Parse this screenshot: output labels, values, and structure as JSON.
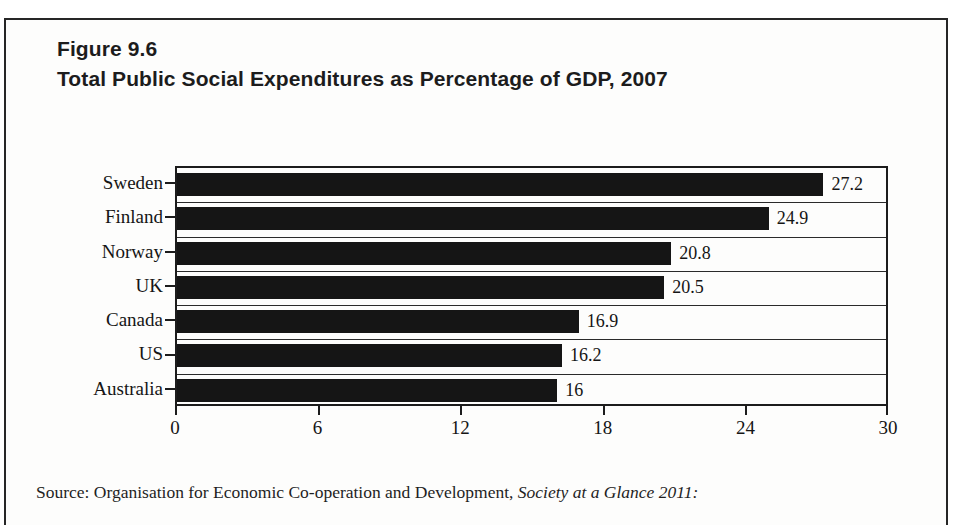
{
  "figure": {
    "number": "Figure 9.6",
    "title": "Total Public Social Expenditures as Percentage of GDP, 2007"
  },
  "source_note": {
    "prefix": "Source: Organisation for Economic Co-operation and Development,",
    "italic_title": "Society at a Glance 2011:"
  },
  "chart_data": {
    "type": "bar",
    "orientation": "horizontal",
    "title": "Total Public Social Expenditures as Percentage of GDP, 2007",
    "xlabel": "",
    "ylabel": "",
    "xlim": [
      0,
      30
    ],
    "xticks": [
      0,
      6,
      12,
      18,
      24,
      30
    ],
    "xtick_labels": [
      "0",
      "6",
      "12",
      "18",
      "24",
      "30"
    ],
    "grid": false,
    "legend": false,
    "bar_color": "#151515",
    "categories": [
      "Sweden",
      "Finland",
      "Norway",
      "UK",
      "Canada",
      "US",
      "Australia"
    ],
    "values": [
      27.2,
      24.9,
      20.8,
      20.5,
      16.9,
      16.2,
      16
    ],
    "value_labels": [
      "27.2",
      "24.9",
      "20.8",
      "20.5",
      "16.9",
      "16.2",
      "16"
    ]
  }
}
